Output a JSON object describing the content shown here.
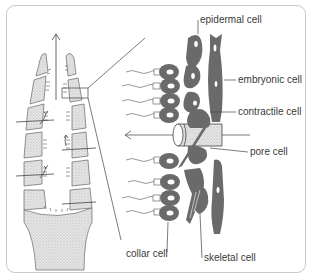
{
  "diagram": {
    "type": "labeled-biological-illustration",
    "labels": [
      {
        "id": "epidermal",
        "text": "epidermal cell"
      },
      {
        "id": "embryonic",
        "text": "embryonic cell"
      },
      {
        "id": "contractile",
        "text": "contractile cell"
      },
      {
        "id": "pore",
        "text": "pore cell"
      },
      {
        "id": "collar",
        "text": "collar cell"
      },
      {
        "id": "skeletal",
        "text": "skeletal cell"
      }
    ],
    "colors": {
      "cell_fill": "#6a6a6a",
      "nucleus": "#ffffff",
      "stipple": "#d8d8d8",
      "line": "#555555",
      "frame": "#c9c9c9"
    }
  }
}
